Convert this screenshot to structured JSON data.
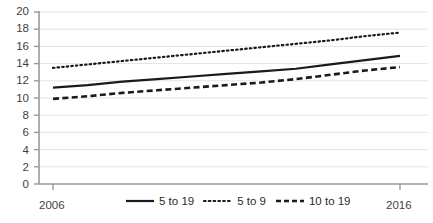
{
  "chart_data": {
    "type": "line",
    "title": "",
    "xlabel": "",
    "ylabel": "",
    "x": [
      2006,
      2007,
      2008,
      2009,
      2010,
      2011,
      2012,
      2013,
      2014,
      2015,
      2016
    ],
    "xlim": [
      2006,
      2016
    ],
    "ylim": [
      0,
      20
    ],
    "ytick_values": [
      0,
      2,
      4,
      6,
      8,
      10,
      12,
      14,
      16,
      18,
      20
    ],
    "ytick_labels": [
      "0",
      "2",
      "4",
      "6",
      "8",
      "10",
      "12",
      "14",
      "16",
      "18",
      "20"
    ],
    "xtick_values": [
      2006,
      2016
    ],
    "xtick_labels": [
      "2006",
      "2016"
    ],
    "grid": "horizontal",
    "legend_position": "bottom",
    "series": [
      {
        "name": "5 to 19",
        "style": "solid",
        "color": "#1a1a1a",
        "values": [
          11.2,
          11.5,
          11.9,
          12.2,
          12.5,
          12.8,
          13.1,
          13.4,
          13.9,
          14.4,
          14.9
        ]
      },
      {
        "name": "5 to 9",
        "style": "dotted",
        "color": "#1a1a1a",
        "values": [
          13.5,
          13.9,
          14.3,
          14.7,
          15.1,
          15.5,
          15.9,
          16.3,
          16.7,
          17.2,
          17.6
        ]
      },
      {
        "name": "10 to 19",
        "style": "dashed",
        "color": "#1a1a1a",
        "values": [
          9.9,
          10.2,
          10.6,
          10.9,
          11.2,
          11.5,
          11.8,
          12.2,
          12.7,
          13.2,
          13.6
        ]
      }
    ]
  },
  "axis": {
    "y_labels": [
      "20",
      "18",
      "16",
      "14",
      "12",
      "10",
      "8",
      "6",
      "4",
      "2",
      "0"
    ],
    "x_label_left": "2006",
    "x_label_right": "2016"
  },
  "legend": {
    "items": [
      {
        "label": "5 to 19",
        "style": "solid"
      },
      {
        "label": "5 to 9",
        "style": "dotted"
      },
      {
        "label": "10 to 19",
        "style": "dashed"
      }
    ]
  },
  "colors": {
    "line": "#1a1a1a",
    "axis": "#9a9a9a",
    "grid": "#e3e3e3",
    "text": "#3f3f3f"
  }
}
